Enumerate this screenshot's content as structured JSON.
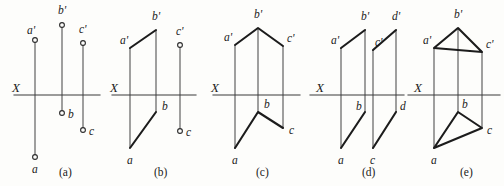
{
  "figure": {
    "width": 504,
    "height": 186,
    "background_color": "#fdfdfb",
    "line_color": "#1c1c1c",
    "thin_line_color": "#4a4a4a",
    "axis_color": "#3a3a3a"
  },
  "panels": [
    {
      "id": "a",
      "caption": "(a)",
      "caption_pos": [
        59,
        176
      ],
      "axis": {
        "label": "X",
        "label_pos": [
          12,
          92
        ],
        "y": 95,
        "x_start": 14,
        "x_end": 100
      },
      "projectors": [
        {
          "name": "projector-a",
          "x": 35,
          "y1": 40,
          "y2": 157
        },
        {
          "name": "projector-b",
          "x": 62,
          "y1": 25,
          "y2": 113
        },
        {
          "name": "projector-c",
          "x": 83,
          "y1": 43,
          "y2": 130
        }
      ],
      "points": [
        {
          "name": "a-prime",
          "label": "a'",
          "x": 35,
          "y": 40,
          "label_pos": [
            27,
            34
          ]
        },
        {
          "name": "b-prime",
          "label": "b'",
          "x": 62,
          "y": 25,
          "label_pos": [
            58,
            14
          ]
        },
        {
          "name": "c-prime",
          "label": "c'",
          "x": 83,
          "y": 43,
          "label_pos": [
            79,
            33
          ]
        },
        {
          "name": "a-point",
          "label": "a",
          "x": 35,
          "y": 157,
          "label_pos": [
            32,
            173
          ]
        },
        {
          "name": "b-point",
          "label": "b",
          "x": 62,
          "y": 113,
          "label_pos": [
            68,
            118
          ]
        },
        {
          "name": "c-point",
          "label": "c",
          "x": 83,
          "y": 130,
          "label_pos": [
            89,
            135
          ]
        }
      ],
      "segments": []
    },
    {
      "id": "b",
      "caption": "(b)",
      "caption_pos": [
        154,
        176
      ],
      "axis": {
        "label": "X",
        "label_pos": [
          110,
          92
        ],
        "y": 95,
        "x_start": 112,
        "x_end": 196
      },
      "projectors": [
        {
          "name": "projector-a",
          "x": 130,
          "y1": 48,
          "y2": 148
        },
        {
          "name": "projector-b",
          "x": 156,
          "y1": 30,
          "y2": 112
        },
        {
          "name": "projector-c",
          "x": 180,
          "y1": 45,
          "y2": 131
        }
      ],
      "points": [
        {
          "name": "a-prime",
          "label": "a'",
          "x": 130,
          "y": 48,
          "label_pos": [
            120,
            44
          ]
        },
        {
          "name": "b-prime",
          "label": "b'",
          "x": 156,
          "y": 30,
          "label_pos": [
            152,
            20
          ]
        },
        {
          "name": "c-prime",
          "label": "c'",
          "x": 180,
          "y": 45,
          "label_pos": [
            176,
            35
          ]
        },
        {
          "name": "a-point",
          "label": "a",
          "x": 130,
          "y": 148,
          "label_pos": [
            127,
            164
          ]
        },
        {
          "name": "b-point",
          "label": "b",
          "x": 156,
          "y": 112,
          "label_pos": [
            162,
            110
          ]
        },
        {
          "name": "c-point",
          "label": "c",
          "x": 180,
          "y": 131,
          "label_pos": [
            186,
            136
          ]
        }
      ],
      "segments": [
        {
          "name": "segment-ab-prime",
          "pts": [
            [
              130,
              48
            ],
            [
              156,
              30
            ]
          ]
        },
        {
          "name": "segment-ab",
          "pts": [
            [
              130,
              148
            ],
            [
              156,
              112
            ]
          ]
        }
      ]
    },
    {
      "id": "c",
      "caption": "(c)",
      "caption_pos": [
        256,
        176
      ],
      "axis": {
        "label": "X",
        "label_pos": [
          211,
          92
        ],
        "y": 95,
        "x_start": 213,
        "x_end": 300
      },
      "projectors": [
        {
          "name": "projector-a",
          "x": 235,
          "y1": 45,
          "y2": 148
        },
        {
          "name": "projector-b",
          "x": 258,
          "y1": 28,
          "y2": 112
        },
        {
          "name": "projector-c",
          "x": 283,
          "y1": 46,
          "y2": 128
        }
      ],
      "points": [
        {
          "name": "a-prime",
          "label": "a'",
          "x": 235,
          "y": 45,
          "label_pos": [
            224,
            41
          ]
        },
        {
          "name": "b-prime",
          "label": "b'",
          "x": 258,
          "y": 28,
          "label_pos": [
            254,
            18
          ]
        },
        {
          "name": "c-prime",
          "label": "c'",
          "x": 283,
          "y": 46,
          "label_pos": [
            287,
            42
          ]
        },
        {
          "name": "a-point",
          "label": "a",
          "x": 235,
          "y": 148,
          "label_pos": [
            232,
            164
          ]
        },
        {
          "name": "b-point",
          "label": "b",
          "x": 258,
          "y": 112,
          "label_pos": [
            264,
            108
          ]
        },
        {
          "name": "c-point",
          "label": "c",
          "x": 283,
          "y": 128,
          "label_pos": [
            289,
            134
          ]
        }
      ],
      "segments": [
        {
          "name": "polyline-abc-prime",
          "pts": [
            [
              235,
              45
            ],
            [
              258,
              28
            ],
            [
              283,
              46
            ]
          ]
        },
        {
          "name": "polyline-abc",
          "pts": [
            [
              235,
              148
            ],
            [
              258,
              112
            ],
            [
              283,
              128
            ]
          ]
        }
      ]
    },
    {
      "id": "d",
      "caption": "(d)",
      "caption_pos": [
        362,
        176
      ],
      "axis": {
        "label": "X",
        "label_pos": [
          316,
          92
        ],
        "y": 95,
        "x_start": 310,
        "x_end": 404
      },
      "projectors": [
        {
          "name": "projector-a",
          "x": 341,
          "y1": 48,
          "y2": 148
        },
        {
          "name": "projector-b",
          "x": 365,
          "y1": 30,
          "y2": 112
        },
        {
          "name": "projector-c",
          "x": 373,
          "y1": 50,
          "y2": 148
        },
        {
          "name": "projector-d",
          "x": 396,
          "y1": 30,
          "y2": 112
        }
      ],
      "points": [
        {
          "name": "a-prime",
          "label": "a'",
          "x": 341,
          "y": 48,
          "label_pos": [
            331,
            44
          ]
        },
        {
          "name": "b-prime",
          "label": "b'",
          "x": 365,
          "y": 30,
          "label_pos": [
            361,
            20
          ]
        },
        {
          "name": "c-prime",
          "label": "c'",
          "x": 373,
          "y": 50,
          "label_pos": [
            375,
            46
          ]
        },
        {
          "name": "d-prime",
          "label": "d'",
          "x": 396,
          "y": 30,
          "label_pos": [
            392,
            20
          ]
        },
        {
          "name": "a-point",
          "label": "a",
          "x": 341,
          "y": 148,
          "label_pos": [
            338,
            164
          ]
        },
        {
          "name": "b-point",
          "label": "b",
          "x": 365,
          "y": 112,
          "label_pos": [
            356,
            110
          ]
        },
        {
          "name": "c-point",
          "label": "c",
          "x": 373,
          "y": 148,
          "label_pos": [
            370,
            164
          ]
        },
        {
          "name": "d-point",
          "label": "d",
          "x": 396,
          "y": 112,
          "label_pos": [
            400,
            110
          ]
        }
      ],
      "segments": [
        {
          "name": "segment-ab-prime",
          "pts": [
            [
              341,
              48
            ],
            [
              365,
              30
            ]
          ]
        },
        {
          "name": "segment-cd-prime",
          "pts": [
            [
              373,
              50
            ],
            [
              396,
              30
            ]
          ]
        },
        {
          "name": "segment-ab",
          "pts": [
            [
              341,
              148
            ],
            [
              365,
              112
            ]
          ]
        },
        {
          "name": "segment-cd",
          "pts": [
            [
              373,
              148
            ],
            [
              396,
              112
            ]
          ]
        }
      ]
    },
    {
      "id": "e",
      "caption": "(e)",
      "caption_pos": [
        460,
        176
      ],
      "axis": {
        "label": "X",
        "label_pos": [
          414,
          92
        ],
        "y": 95,
        "x_start": 408,
        "x_end": 500
      },
      "projectors": [
        {
          "name": "projector-a",
          "x": 434,
          "y1": 48,
          "y2": 148
        },
        {
          "name": "projector-b",
          "x": 458,
          "y1": 28,
          "y2": 112
        },
        {
          "name": "projector-c",
          "x": 482,
          "y1": 52,
          "y2": 128
        }
      ],
      "points": [
        {
          "name": "a-prime",
          "label": "a'",
          "x": 434,
          "y": 48,
          "label_pos": [
            423,
            44
          ]
        },
        {
          "name": "b-prime",
          "label": "b'",
          "x": 458,
          "y": 28,
          "label_pos": [
            454,
            18
          ]
        },
        {
          "name": "c-prime",
          "label": "c'",
          "x": 482,
          "y": 52,
          "label_pos": [
            486,
            48
          ]
        },
        {
          "name": "a-point",
          "label": "a",
          "x": 434,
          "y": 148,
          "label_pos": [
            431,
            164
          ]
        },
        {
          "name": "b-point",
          "label": "b",
          "x": 458,
          "y": 112,
          "label_pos": [
            462,
            108
          ]
        },
        {
          "name": "c-point",
          "label": "c",
          "x": 482,
          "y": 128,
          "label_pos": [
            487,
            134
          ]
        }
      ],
      "segments": [
        {
          "name": "triangle-abc-prime",
          "pts": [
            [
              434,
              48
            ],
            [
              458,
              28
            ],
            [
              482,
              52
            ],
            [
              434,
              48
            ]
          ]
        },
        {
          "name": "triangle-abc",
          "pts": [
            [
              434,
              148
            ],
            [
              458,
              112
            ],
            [
              482,
              128
            ],
            [
              434,
              148
            ]
          ]
        }
      ]
    }
  ]
}
